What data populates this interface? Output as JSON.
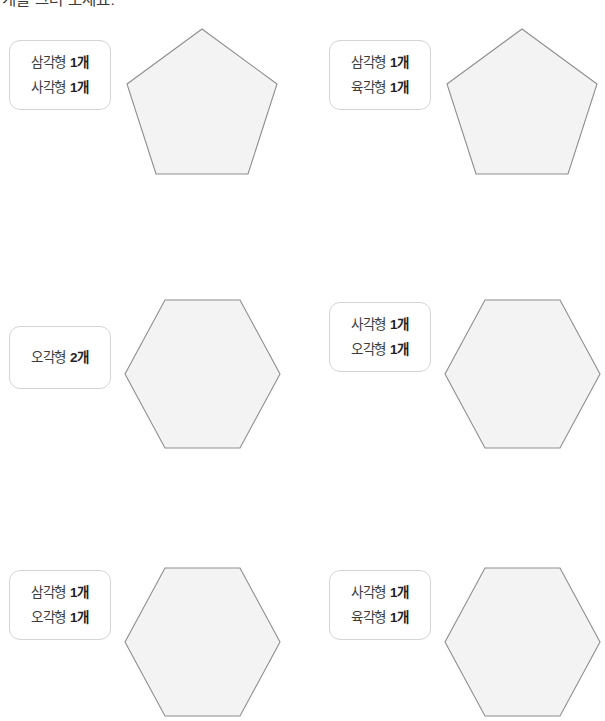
{
  "worksheet": {
    "instruction": "개를 그려 보세요.",
    "shape_fill_color": "#f3f3f3",
    "shape_stroke_color": "#8e8e8e",
    "box_border_color": "#d2d4d6",
    "cells": [
      {
        "position": "row1-left",
        "shape": "pentagon",
        "labels": [
          {
            "shape_name": "삼각형",
            "count": "1개"
          },
          {
            "shape_name": "사각형",
            "count": "1개"
          }
        ]
      },
      {
        "position": "row1-right",
        "shape": "pentagon",
        "labels": [
          {
            "shape_name": "삼각형",
            "count": "1개"
          },
          {
            "shape_name": "육각형",
            "count": "1개"
          }
        ]
      },
      {
        "position": "row2-left",
        "shape": "hexagon",
        "labels": [
          {
            "shape_name": "오각형",
            "count": "2개"
          }
        ]
      },
      {
        "position": "row2-right",
        "shape": "hexagon",
        "labels": [
          {
            "shape_name": "사각형",
            "count": "1개"
          },
          {
            "shape_name": "오각형",
            "count": "1개"
          }
        ]
      },
      {
        "position": "row3-left",
        "shape": "hexagon",
        "labels": [
          {
            "shape_name": "삼각형",
            "count": "1개"
          },
          {
            "shape_name": "오각형",
            "count": "1개"
          }
        ]
      },
      {
        "position": "row3-right",
        "shape": "hexagon",
        "labels": [
          {
            "shape_name": "사각형",
            "count": "1개"
          },
          {
            "shape_name": "육각형",
            "count": "1개"
          }
        ]
      }
    ]
  }
}
